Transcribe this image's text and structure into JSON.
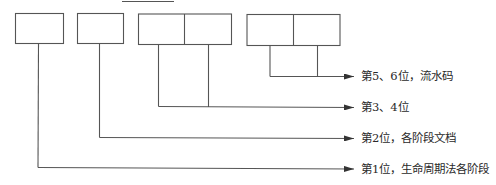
{
  "diagram": {
    "title_underline": true,
    "boxes": [
      {
        "id": "box-1",
        "cells": 1,
        "represents": "第1位"
      },
      {
        "id": "box-2",
        "cells": 1,
        "represents": "第2位"
      },
      {
        "id": "box-3-4",
        "cells": 2,
        "represents": "第3、4位"
      },
      {
        "id": "box-5-6",
        "cells": 2,
        "represents": "第5、6位"
      }
    ],
    "labels": [
      {
        "text": "第5、6位，流水码"
      },
      {
        "text": "第3、4位"
      },
      {
        "text": "第2位，各阶段文档"
      },
      {
        "text": "第1位，生命周期法各阶段"
      }
    ],
    "colors": {
      "line": "#555555",
      "text": "#2a2a2a",
      "background": "#ffffff"
    }
  }
}
